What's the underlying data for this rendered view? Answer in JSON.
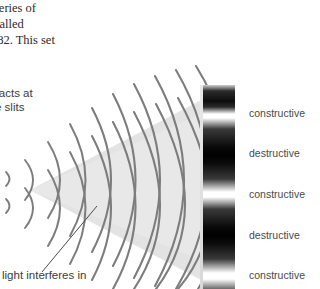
{
  "figure": {
    "top_paragraph": {
      "lines": [
        "series of",
        "called",
        ".82. This set"
      ]
    },
    "slit_caption": {
      "lines": [
        "racts at",
        "e slits"
      ]
    },
    "interference_caption": {
      "text": "light interferes in"
    },
    "fringe_labels": [
      {
        "text": "constructive",
        "y": 107
      },
      {
        "text": "destructive",
        "y": 147
      },
      {
        "text": "constructive",
        "y": 188
      },
      {
        "text": "destructive",
        "y": 229
      },
      {
        "text": "constructive",
        "y": 269
      }
    ],
    "colors": {
      "page_background": "#ffffff",
      "wave_arc": "#7d7d7d",
      "cone_fill": "#e0e0e0",
      "leader_line": "#4a4a4a",
      "body_text": "#2b2b2b",
      "caption_text": "#3b3b3b",
      "label_text": "#4a4a4a",
      "fringe_bright": "#ffffff",
      "fringe_dark": "#000000"
    },
    "geometry": {
      "cone_apex_x": 30,
      "cone_apex_y": 190,
      "cone_top_right_y": 98,
      "cone_bottom_right_y": 282,
      "screen_x": 203,
      "screen_width": 32,
      "source_a_y": 178,
      "source_b_y": 205,
      "leader_from": [
        42,
        272
      ],
      "leader_to": [
        97,
        206
      ],
      "arc_count": 13
    }
  }
}
